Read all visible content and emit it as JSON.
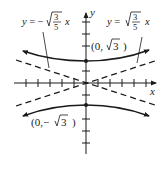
{
  "figure": {
    "type": "hyperbola-graph",
    "equation_branches": "vertical hyperbola opening up/down",
    "axes": {
      "x_label": "x",
      "y_label": "y"
    },
    "asymptotes": [
      {
        "label_prefix": "y = ",
        "sign": "",
        "num": "3",
        "den": "5",
        "var": "x",
        "slope_sign": "positive"
      },
      {
        "label_prefix": "y = ",
        "sign": "−",
        "num": "3",
        "den": "5",
        "var": "x",
        "slope_sign": "negative"
      }
    ],
    "vertices": [
      {
        "label": "(0,",
        "radicand": "3",
        "close": ")",
        "sign": ""
      },
      {
        "label": "(0,",
        "radicand": "3",
        "close": ")",
        "sign": "−"
      }
    ],
    "colors": {
      "ink": "#1a1a1a",
      "background": "#ffffff"
    }
  }
}
